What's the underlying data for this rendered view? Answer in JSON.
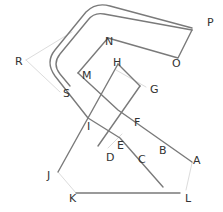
{
  "diagram": {
    "type": "geometric-line-diagram",
    "colors": {
      "line": "#7a7a7a",
      "faint": "#d8d8d8",
      "label": "#333333"
    },
    "labels": [
      {
        "id": "P",
        "text": "P",
        "x": 207,
        "y": 17
      },
      {
        "id": "N",
        "text": "N",
        "x": 105,
        "y": 36
      },
      {
        "id": "O",
        "text": "O",
        "x": 172,
        "y": 58
      },
      {
        "id": "R",
        "text": "R",
        "x": 15,
        "y": 56
      },
      {
        "id": "M",
        "text": "M",
        "x": 82,
        "y": 70
      },
      {
        "id": "H",
        "text": "H",
        "x": 113,
        "y": 57
      },
      {
        "id": "G",
        "text": "G",
        "x": 150,
        "y": 84
      },
      {
        "id": "S",
        "text": "S",
        "x": 63,
        "y": 88
      },
      {
        "id": "F",
        "text": "F",
        "x": 134,
        "y": 117
      },
      {
        "id": "I",
        "text": "I",
        "x": 87,
        "y": 121
      },
      {
        "id": "E",
        "text": "E",
        "x": 117,
        "y": 140
      },
      {
        "id": "B",
        "text": "B",
        "x": 159,
        "y": 145
      },
      {
        "id": "D",
        "text": "D",
        "x": 106,
        "y": 152
      },
      {
        "id": "C",
        "text": "C",
        "x": 138,
        "y": 154
      },
      {
        "id": "A",
        "text": "A",
        "x": 193,
        "y": 155
      },
      {
        "id": "J",
        "text": "J",
        "x": 47,
        "y": 170
      },
      {
        "id": "K",
        "text": "K",
        "x": 69,
        "y": 193
      },
      {
        "id": "L",
        "text": "L",
        "x": 185,
        "y": 193
      }
    ]
  }
}
